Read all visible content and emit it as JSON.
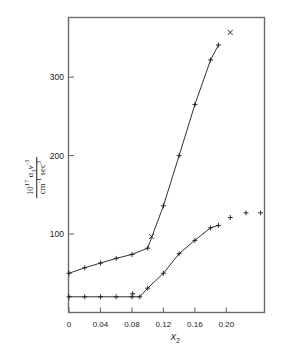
{
  "figure": {
    "background": "#ffffff",
    "frame_color": "#6b6b6b",
    "ink_color": "#1a1a1a"
  },
  "ylabel": {
    "numerator_prefix": "10",
    "numerator_exponent": "17",
    "numerator_alpha": "α",
    "numerator_alpha_sub": "3",
    "numerator_nu": "ν",
    "numerator_nu_exponent": "-3",
    "denominator_cm": "cm",
    "denominator_cm_exponent": "-1",
    "denominator_sec": "sec",
    "denominator_sec_exponent": "3"
  },
  "chart_data": {
    "type": "line",
    "title": "",
    "xlabel": "X₂",
    "ylabel": "10^17 α₃ν^-3 / cm^-1 sec^3",
    "xlim": [
      0,
      0.2485
    ],
    "ylim": [
      0,
      376
    ],
    "grid": false,
    "legend": "none",
    "xticks": [
      0,
      0.04,
      0.08,
      0.12,
      0.16,
      0.2
    ],
    "xticklabels": [
      "0",
      "0.04",
      "0.08",
      "0.12",
      "0.16",
      "0.20"
    ],
    "yticks": [
      100,
      200,
      300
    ],
    "yticklabels": [
      "100",
      "200",
      "300"
    ],
    "series": [
      {
        "name": "upper-branch",
        "marker": "plus",
        "line": true,
        "x": [
          0.0,
          0.02,
          0.04,
          0.06,
          0.08,
          0.1,
          0.12,
          0.14,
          0.16,
          0.18,
          0.19
        ],
        "y": [
          50,
          57,
          63,
          69,
          74,
          82,
          136,
          200,
          265,
          322,
          341
        ]
      },
      {
        "name": "lower-branch",
        "marker": "plus",
        "line": true,
        "x": [
          0.0,
          0.02,
          0.04,
          0.06,
          0.08,
          0.09,
          0.1,
          0.12,
          0.14,
          0.16,
          0.18,
          0.19
        ],
        "y": [
          20,
          20,
          20,
          20,
          20,
          20,
          31,
          50,
          75,
          92,
          108,
          111
        ]
      },
      {
        "name": "upper-outlier-points",
        "marker": "x",
        "line": false,
        "x": [
          0.105,
          0.205
        ],
        "y": [
          97,
          357
        ]
      },
      {
        "name": "lower-outlier-points",
        "marker": "plus",
        "line": false,
        "x": [
          0.081,
          0.205,
          0.225,
          0.2435
        ],
        "y": [
          24,
          121,
          127,
          127
        ]
      }
    ]
  }
}
